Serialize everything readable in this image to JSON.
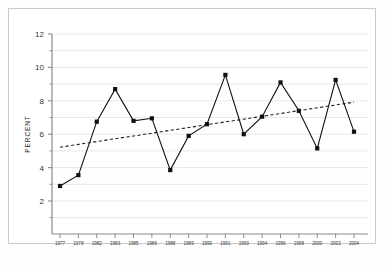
{
  "figure": {
    "background_color": "#ffffff",
    "border_color": "#c9c9c9",
    "series_color": "#111111",
    "trend_color": "#222222",
    "grid_color": "#e8e8e8",
    "axis_color": "#8a8a8a"
  },
  "chart_data": {
    "type": "line",
    "title": "",
    "subtitle": "",
    "xlabel": "",
    "ylabel": "PERCENT",
    "ylim": [
      0,
      12
    ],
    "yticks": [
      2,
      4,
      6,
      8,
      10,
      12
    ],
    "ytick_labels": [
      "2",
      "4",
      "6",
      "8",
      "10",
      "12"
    ],
    "minor_yticks": [
      1,
      3,
      5,
      7,
      9,
      11
    ],
    "grid": true,
    "grid_axis": "y",
    "legend": false,
    "legend_position": "none",
    "categories": [
      "1977",
      "1978",
      "1982",
      "1983",
      "1985",
      "1986",
      "1988",
      "1989",
      "1990",
      "1991",
      "1993",
      "1994",
      "1996",
      "1998",
      "2000",
      "2002",
      "2004"
    ],
    "series": [
      {
        "name": "Percent",
        "marker": "square",
        "linestyle": "solid",
        "values": [
          2.9,
          3.55,
          6.75,
          8.7,
          6.8,
          6.95,
          3.85,
          5.9,
          6.6,
          9.55,
          6.0,
          7.05,
          9.1,
          7.4,
          5.15,
          9.25,
          6.15
        ]
      },
      {
        "name": "Trend",
        "marker": "none",
        "linestyle": "dashed",
        "values": [
          5.22,
          5.39,
          5.56,
          5.73,
          5.89,
          6.06,
          6.23,
          6.4,
          6.57,
          6.74,
          6.9,
          7.07,
          7.24,
          7.41,
          7.58,
          7.75,
          7.92
        ]
      }
    ],
    "annotations": []
  }
}
